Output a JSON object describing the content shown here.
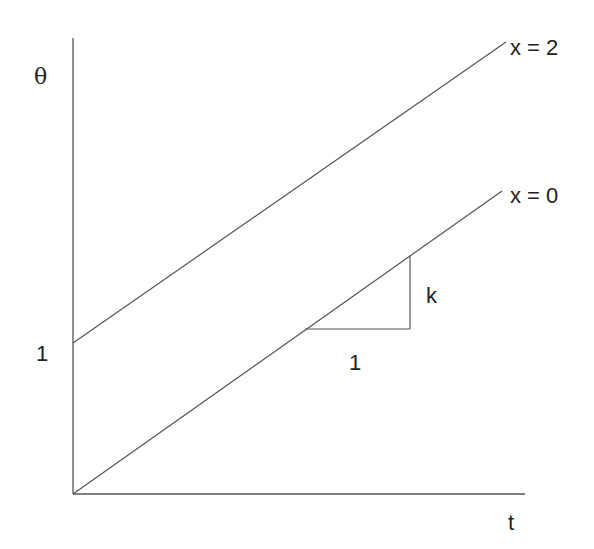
{
  "diagram": {
    "y_axis_label": "θ",
    "x_axis_label": "t",
    "intercept_label": "1",
    "lines": [
      {
        "label": "x = 2",
        "start": [
          0,
          1
        ],
        "slope": "k"
      },
      {
        "label": "x = 0",
        "start": [
          0,
          0
        ],
        "slope": "k"
      }
    ],
    "slope_triangle": {
      "run_label": "1",
      "rise_label": "k"
    },
    "colors": {
      "line": "#555555",
      "text": "#222222"
    }
  }
}
